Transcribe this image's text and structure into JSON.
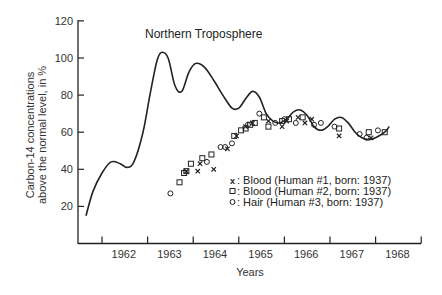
{
  "chart_data": {
    "type": "line",
    "title": "Northern Troposphere",
    "xlabel": "Years",
    "ylabel_lines": [
      "Carbon-14 concentrations",
      "above the normal level, in %"
    ],
    "ylabel": "Carbon-14 concentrations above the normal level, in %",
    "xlim": [
      1961.5,
      1968.5
    ],
    "ylim": [
      0,
      120
    ],
    "yticks": [
      20,
      40,
      60,
      80,
      100,
      120
    ],
    "xtick_labels": [
      "1962",
      "1963",
      "1964",
      "1965",
      "1966",
      "1967",
      "1968"
    ],
    "grid": false,
    "legend_position": "lower right (inside plot)",
    "series": [
      {
        "name": "Northern Troposphere (atmospheric C-14)",
        "style": "line",
        "x": [
          1961.65,
          1961.8,
          1962.0,
          1962.2,
          1962.4,
          1962.55,
          1962.7,
          1962.9,
          1963.05,
          1963.2,
          1963.3,
          1963.45,
          1963.6,
          1963.75,
          1963.9,
          1964.05,
          1964.25,
          1964.45,
          1964.65,
          1964.85,
          1965.0,
          1965.15,
          1965.3,
          1965.45,
          1965.6,
          1965.75,
          1965.9,
          1966.05,
          1966.2,
          1966.35,
          1966.5,
          1966.65,
          1966.8,
          1966.95,
          1967.1,
          1967.25,
          1967.4,
          1967.55,
          1967.7,
          1967.85,
          1968.0,
          1968.2,
          1968.3
        ],
        "values": [
          15,
          28,
          38,
          44,
          43,
          41,
          44,
          60,
          80,
          98,
          103,
          100,
          85,
          82,
          92,
          97,
          95,
          88,
          80,
          73,
          73,
          78,
          82,
          79,
          70,
          66,
          65,
          67,
          71,
          72,
          69,
          63,
          61,
          63,
          67,
          68,
          65,
          60,
          57,
          56,
          57,
          60,
          63
        ]
      },
      {
        "name": "Blood (Human #1, born: 1937)",
        "marker": "x",
        "x": [
          1963.85,
          1964.1,
          1964.15,
          1964.45,
          1964.75,
          1964.95,
          1965.15,
          1965.3,
          1965.65,
          1965.95,
          1966.05,
          1966.3,
          1966.45,
          1966.6,
          1967.2,
          1967.9
        ],
        "values": [
          39,
          39,
          43,
          40,
          51,
          58,
          63,
          65,
          66,
          63,
          66,
          68,
          65,
          67,
          58,
          57
        ]
      },
      {
        "name": "Blood (Human #2, born: 1937)",
        "marker": "square",
        "x": [
          1963.7,
          1963.8,
          1963.85,
          1963.95,
          1964.2,
          1964.4,
          1964.9,
          1965.05,
          1965.15,
          1965.25,
          1965.35,
          1965.55,
          1965.65,
          1965.95,
          1966.1,
          1966.4,
          1967.2,
          1967.85,
          1968.2
        ],
        "values": [
          33,
          38,
          39,
          43,
          46,
          48,
          58,
          61,
          62,
          64,
          65,
          68,
          63,
          66,
          67,
          68,
          62,
          60,
          60
        ]
      },
      {
        "name": "Hair (Human #3, born: 1937)",
        "marker": "circle",
        "x": [
          1963.5,
          1964.3,
          1964.6,
          1964.7,
          1964.85,
          1965.2,
          1965.45,
          1965.8,
          1966.0,
          1966.25,
          1966.65,
          1966.8,
          1967.1,
          1967.65,
          1967.8,
          1968.05
        ],
        "values": [
          27,
          44,
          52,
          52,
          54,
          64,
          70,
          65,
          67,
          65,
          64,
          65,
          63,
          59,
          57,
          61
        ]
      }
    ]
  },
  "legend": {
    "items": [
      {
        "symbol": "x",
        "label": ": Blood (Human #1, born: 1937)"
      },
      {
        "symbol": "□",
        "label": ": Blood (Human #2, born: 1937)"
      },
      {
        "symbol": "o",
        "label": ": Hair (Human #3, born: 1937)"
      }
    ]
  },
  "colors": {
    "ink": "#222222",
    "background": "#ffffff"
  }
}
